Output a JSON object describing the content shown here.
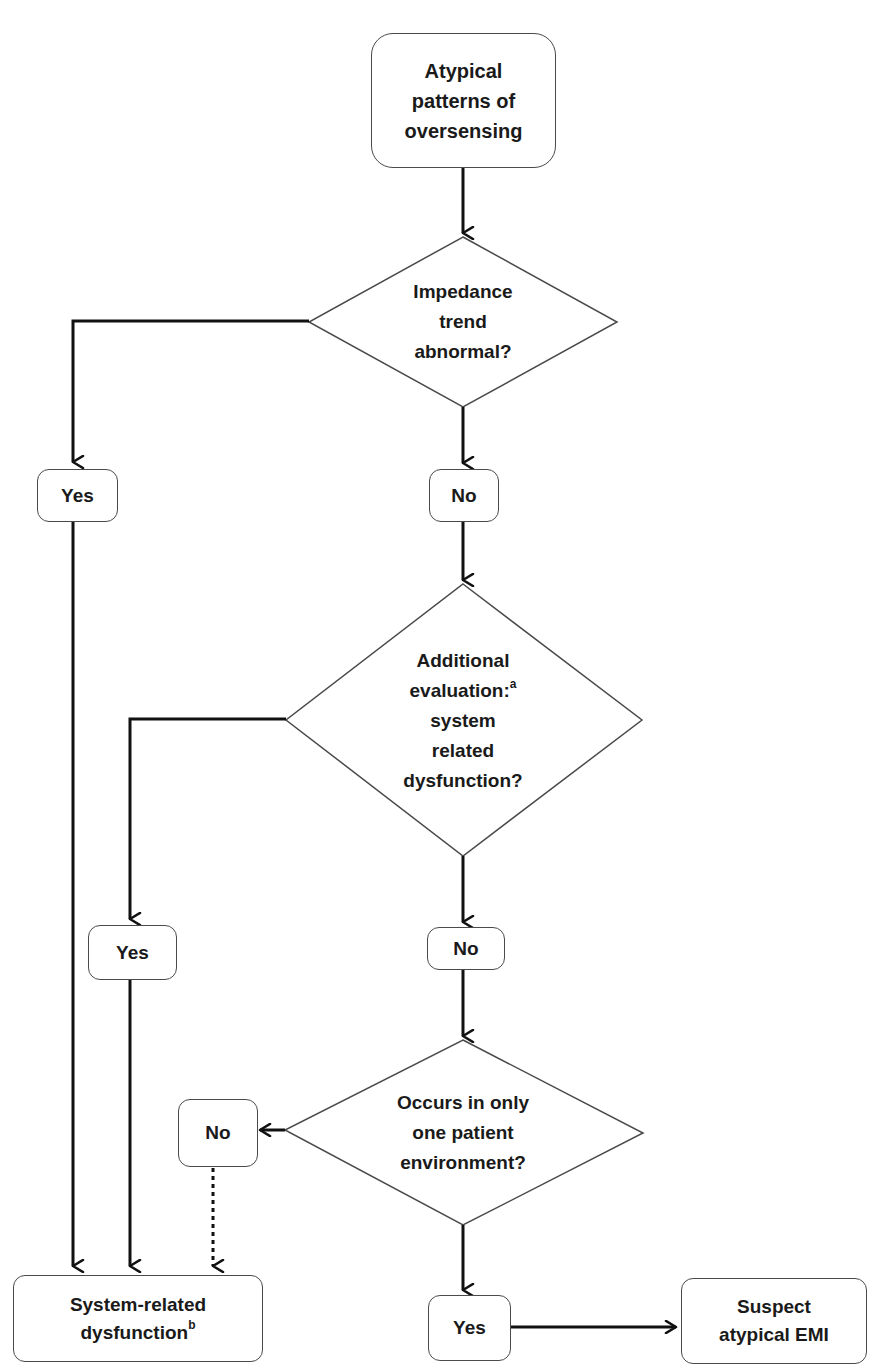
{
  "diagram": {
    "type": "flowchart",
    "start": {
      "id": "n0",
      "label": "Atypical patterns of oversensing",
      "lines": [
        "Atypical",
        "patterns of",
        "oversensing"
      ]
    },
    "decisions": [
      {
        "id": "d1",
        "lines": [
          "Impedance",
          "trend",
          "abnormal?"
        ]
      },
      {
        "id": "d2",
        "lines": [
          "Additional",
          "evaluation:",
          "system",
          "related",
          "dysfunction?"
        ],
        "superscript": "a"
      },
      {
        "id": "d3",
        "lines": [
          "Occurs in only",
          "one patient",
          "environment?"
        ]
      }
    ],
    "answers": {
      "d1_yes": "Yes",
      "d1_no": "No",
      "d2_yes": "Yes",
      "d2_no": "No",
      "d3_no": "No",
      "d3_yes": "Yes"
    },
    "outcomes": {
      "system_related": {
        "text": "System-related",
        "text2": "dysfunction",
        "superscript": "b"
      },
      "emi": {
        "line1": "Suspect",
        "line2": "atypical EMI"
      }
    },
    "edges": [
      {
        "from": "n0",
        "to": "d1",
        "style": "solid"
      },
      {
        "from": "d1",
        "to": "d1_yes",
        "style": "solid"
      },
      {
        "from": "d1",
        "to": "d1_no",
        "style": "solid"
      },
      {
        "from": "d1_yes",
        "to": "system_related",
        "style": "solid"
      },
      {
        "from": "d1_no",
        "to": "d2",
        "style": "solid"
      },
      {
        "from": "d2",
        "to": "d2_yes",
        "style": "solid"
      },
      {
        "from": "d2",
        "to": "d2_no",
        "style": "solid"
      },
      {
        "from": "d2_yes",
        "to": "system_related",
        "style": "solid"
      },
      {
        "from": "d2_no",
        "to": "d3",
        "style": "solid"
      },
      {
        "from": "d3",
        "to": "d3_no",
        "style": "solid"
      },
      {
        "from": "d3",
        "to": "d3_yes",
        "style": "solid"
      },
      {
        "from": "d3_no",
        "to": "system_related",
        "style": "dotted"
      },
      {
        "from": "d3_yes",
        "to": "emi",
        "style": "solid"
      }
    ],
    "colors": {
      "stroke": "#4a4a4a",
      "line": "#111111",
      "background": "#ffffff"
    }
  }
}
